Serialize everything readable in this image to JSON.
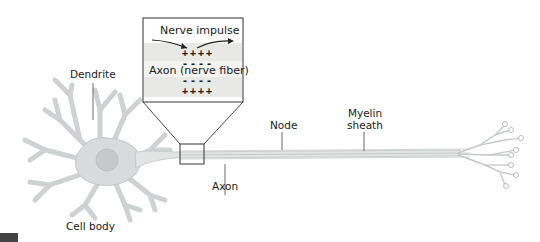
{
  "figure": {
    "labels": {
      "dendrite": "Dendrite",
      "cell_body": "Cell body",
      "axon": "Axon",
      "node": "Node",
      "myelin_sheath_line1": "Myelin",
      "myelin_sheath_line2": "sheath"
    },
    "inset": {
      "title": "Nerve impulse",
      "axon_label": "Axon (nerve fiber)",
      "top_charges": "++++",
      "upper_neg_charges": "----",
      "lower_neg_charges": "----",
      "bottom_charges": "++++"
    },
    "colors": {
      "neuron_fill": "#d8dadb",
      "neuron_stroke": "#bfc2c4",
      "nucleus": "#c9cbcc",
      "inset_membrane": "#e6e7e5",
      "inset_axon": "#f0f0ee",
      "line": "#333333",
      "text": "#1a1a1a",
      "corner_block": "#444444"
    }
  }
}
